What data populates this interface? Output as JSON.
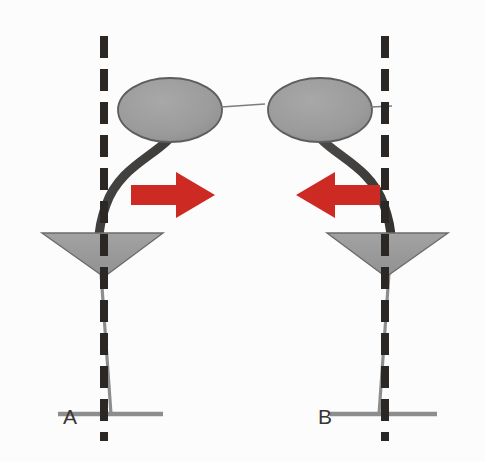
{
  "figure": {
    "background_color": "#fdfcfc",
    "width": 485,
    "height": 462
  },
  "colors": {
    "organ_fill": "#9a9a9a",
    "organ_stroke": "#5d5d5d",
    "funnel_fill": "#9a9a9a",
    "funnel_stroke": "#6b6b6b",
    "stem_dark": "#3b3a38",
    "stem_light": "#8d8d8d",
    "midline_dash": "#2a2724",
    "arrow_red": "#cc2a22",
    "baseline_gray": "#8d8d8d",
    "label_text": "#3a3633",
    "leader_line": "#7d7d7d"
  },
  "panels": [
    {
      "id": "A",
      "label": "A",
      "label_x": 63,
      "label_y": 424,
      "arrow": {
        "direction": "right",
        "name": "deviation-arrow-right",
        "color": "#cc2a22",
        "x": 131,
        "y": 172,
        "width": 84,
        "height": 46
      },
      "midline": {
        "x": 104,
        "y_top": 36,
        "y_bottom": 440,
        "dash_width": 8,
        "dash_length": 22,
        "dash_gap": 11
      },
      "organ": {
        "name": "organ-ellipse",
        "cx": 170,
        "cy": 110,
        "rx": 52,
        "ry": 32,
        "leader_x1": 222,
        "leader_x2": 265,
        "leader_y": 107
      },
      "funnel": {
        "name": "funnel-triangle",
        "left_x": 42,
        "right_x": 163,
        "top_y": 233,
        "apex_x": 104,
        "apex_y": 277
      },
      "stem_curve": "M 168 140 C 150 158 118 170 106 205 C 100 222 99 230 99 237",
      "lower_stem": {
        "x1": 101,
        "y1": 273,
        "x2": 111,
        "y2": 414
      },
      "baseline": {
        "x1": 58,
        "x2": 163,
        "y": 414
      }
    },
    {
      "id": "B",
      "label": "B",
      "label_x": 318,
      "label_y": 424,
      "arrow": {
        "direction": "left",
        "name": "deviation-arrow-left",
        "color": "#cc2a22",
        "x": 296,
        "y": 172,
        "width": 84,
        "height": 46
      },
      "midline": {
        "x": 385,
        "y_top": 36,
        "y_bottom": 440,
        "dash_width": 8,
        "dash_length": 22,
        "dash_gap": 11
      },
      "organ": {
        "name": "organ-ellipse",
        "cx": 320,
        "cy": 110,
        "rx": 52,
        "ry": 32,
        "leader_x1": 372,
        "leader_x2": 392,
        "leader_y": 107
      },
      "funnel": {
        "name": "funnel-triangle",
        "left_x": 327,
        "right_x": 448,
        "top_y": 233,
        "apex_x": 386,
        "apex_y": 277
      },
      "stem_curve": "M 322 140 C 340 158 372 170 384 205 C 390 222 391 230 391 237",
      "lower_stem": {
        "x1": 389,
        "y1": 273,
        "x2": 379,
        "y2": 414
      },
      "baseline": {
        "x1": 330,
        "x2": 437,
        "y": 414
      }
    }
  ],
  "legend": {
    "midline_name": "vertical midline reference",
    "arrow_meaning_a": "deviation to the right",
    "arrow_meaning_b": "deviation to the left"
  }
}
